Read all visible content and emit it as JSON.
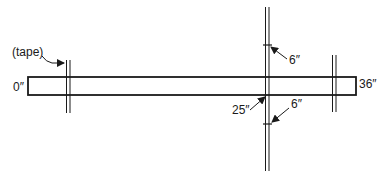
{
  "diagram": {
    "colors": {
      "ink": "#1a1a1a",
      "background": "#ffffff"
    },
    "board": {
      "x": 28,
      "y": 77,
      "width": 328,
      "height": 18
    },
    "tapes": [
      {
        "id": "left",
        "x": 68,
        "y1": 60,
        "y2": 113
      },
      {
        "id": "middle",
        "x": 267,
        "y1": 7,
        "y2": 171
      },
      {
        "id": "right",
        "x": 334,
        "y1": 55,
        "y2": 112
      }
    ],
    "ticks": [
      {
        "x": 267,
        "y": 45
      },
      {
        "x": 267,
        "y": 124
      }
    ],
    "labels": {
      "tape": "(tape)",
      "start": "0″",
      "end": "36″",
      "mark_position": "25″",
      "offset_top": "6″",
      "offset_bottom": "6″"
    }
  }
}
